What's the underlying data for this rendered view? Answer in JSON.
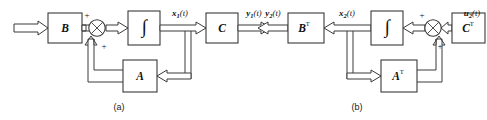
{
  "figure": {
    "background_color": "#ffffff",
    "line_color": "#3a3a3a",
    "text_color": "#111111"
  },
  "panels": [
    {
      "id": "a",
      "caption": "(a)",
      "description": "Primal system: x1' = A x1 + B u1, y1 = C x1",
      "input_label": "u",
      "input_sub": "1",
      "input_arg": "(t)",
      "state_label": "x",
      "state_sub": "1",
      "state_arg": "(t)",
      "output_label": "y",
      "output_sub": "1",
      "output_arg": "(t)",
      "blocks": [
        {
          "name": "input-gain-block",
          "label": "B",
          "sup": ""
        },
        {
          "name": "integrator-block",
          "label": "∫",
          "sup": ""
        },
        {
          "name": "output-gain-block",
          "label": "C",
          "sup": ""
        },
        {
          "name": "feedback-gain-block",
          "label": "A",
          "sup": ""
        }
      ],
      "summing_junction": {
        "name": "summing-junction",
        "signs": [
          "+",
          "+"
        ]
      },
      "sign_top": "+",
      "sign_bottom": "+"
    },
    {
      "id": "b",
      "caption": "(b)",
      "description": "Dual system: x2' = A^T x2 + C^T u2, y2 = B^T x2",
      "input_label": "u",
      "input_sub": "2",
      "input_arg": "(t)",
      "state_label": "x",
      "state_sub": "2",
      "state_arg": "(t)",
      "output_label": "y",
      "output_sub": "2",
      "output_arg": "(t)",
      "blocks": [
        {
          "name": "input-gain-block",
          "label": "C",
          "sup": "T"
        },
        {
          "name": "integrator-block",
          "label": "∫",
          "sup": ""
        },
        {
          "name": "output-gain-block",
          "label": "B",
          "sup": "T"
        },
        {
          "name": "feedback-gain-block",
          "label": "A",
          "sup": "T"
        }
      ],
      "summing_junction": {
        "name": "summing-junction",
        "signs": [
          "+",
          "+"
        ]
      },
      "sign_top": "+",
      "sign_bottom": "+"
    }
  ],
  "glyphs": {
    "integral": "∫",
    "transpose": "T"
  }
}
